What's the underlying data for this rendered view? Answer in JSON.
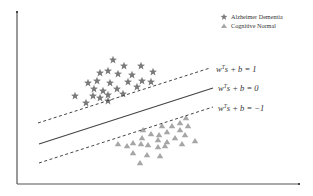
{
  "diagram": {
    "type": "svm-decision-boundary",
    "legend": [
      {
        "label": "Alzheimer Dementia",
        "marker": "star-icon",
        "color": "#7a7a7a"
      },
      {
        "label": "Cognitive Normal",
        "marker": "triangle-icon",
        "color": "#a6a6a6"
      }
    ],
    "equations": {
      "upper_margin": {
        "w": "w",
        "sup": "T",
        "rest": "s + b = 1"
      },
      "boundary": {
        "w": "w",
        "sup": "T",
        "rest": "s + b = 0"
      },
      "lower_margin": {
        "w": "w",
        "sup": "T",
        "rest": "s + b = −1"
      }
    },
    "classes": {
      "alzheimer_dementia_points": [
        [
          113,
          60
        ],
        [
          124,
          66
        ],
        [
          141,
          66
        ],
        [
          153,
          72
        ],
        [
          100,
          73
        ],
        [
          108,
          71
        ],
        [
          118,
          74
        ],
        [
          132,
          75
        ],
        [
          88,
          83
        ],
        [
          97,
          81
        ],
        [
          110,
          83
        ],
        [
          128,
          82
        ],
        [
          142,
          81
        ],
        [
          151,
          82
        ],
        [
          94,
          89
        ],
        [
          103,
          91
        ],
        [
          117,
          89
        ],
        [
          137,
          87
        ],
        [
          75,
          96
        ],
        [
          93,
          96
        ],
        [
          100,
          98
        ],
        [
          108,
          95
        ],
        [
          123,
          94
        ],
        [
          86,
          103
        ],
        [
          108,
          101
        ]
      ],
      "cognitive_normal_points": [
        [
          186,
          118
        ],
        [
          180,
          123
        ],
        [
          188,
          126
        ],
        [
          162,
          126
        ],
        [
          172,
          126
        ],
        [
          180,
          130
        ],
        [
          167,
          132
        ],
        [
          143,
          130
        ],
        [
          151,
          134
        ],
        [
          159,
          135
        ],
        [
          185,
          135
        ],
        [
          142,
          138
        ],
        [
          158,
          140
        ],
        [
          167,
          142
        ],
        [
          175,
          138
        ],
        [
          195,
          141
        ],
        [
          118,
          144
        ],
        [
          127,
          146
        ],
        [
          133,
          143
        ],
        [
          141,
          144
        ],
        [
          148,
          145
        ],
        [
          158,
          147
        ],
        [
          165,
          146
        ],
        [
          182,
          144
        ],
        [
          133,
          153
        ],
        [
          147,
          155
        ],
        [
          160,
          156
        ],
        [
          140,
          163
        ]
      ]
    }
  }
}
